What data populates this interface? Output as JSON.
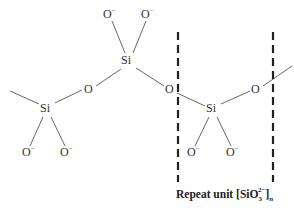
{
  "diagram": {
    "atoms": {
      "si_left": {
        "symbol": "Si",
        "x": 47,
        "y": 112
      },
      "si_top": {
        "symbol": "Si",
        "x": 128,
        "y": 64
      },
      "si_right": {
        "symbol": "Si",
        "x": 213,
        "y": 112
      },
      "o_bridge_left": {
        "symbol": "O",
        "x": 89,
        "y": 93
      },
      "o_bridge_center": {
        "symbol": "O",
        "x": 170,
        "y": 93
      },
      "o_bridge_right": {
        "symbol": "O",
        "x": 256,
        "y": 93
      },
      "o_top_left": {
        "symbol": "O",
        "charge": "−",
        "x": 108,
        "y": 18
      },
      "o_top_right": {
        "symbol": "O",
        "charge": "−",
        "x": 146,
        "y": 18
      },
      "o_bottom_1": {
        "symbol": "O",
        "charge": "−",
        "x": 27,
        "y": 156
      },
      "o_bottom_2": {
        "symbol": "O",
        "charge": "−",
        "x": 65,
        "y": 156
      },
      "o_bottom_3": {
        "symbol": "O",
        "charge": "−",
        "x": 192,
        "y": 156
      },
      "o_bottom_4": {
        "symbol": "O",
        "charge": "−",
        "x": 231,
        "y": 156
      }
    },
    "repeat_unit": {
      "prefix": "Repeat unit [SiO",
      "subscript": "3",
      "superscript": "2−",
      "suffix": "]",
      "n": "n"
    },
    "colors": {
      "bond": "#555555",
      "dash": "#222222",
      "text": "#333333"
    }
  }
}
